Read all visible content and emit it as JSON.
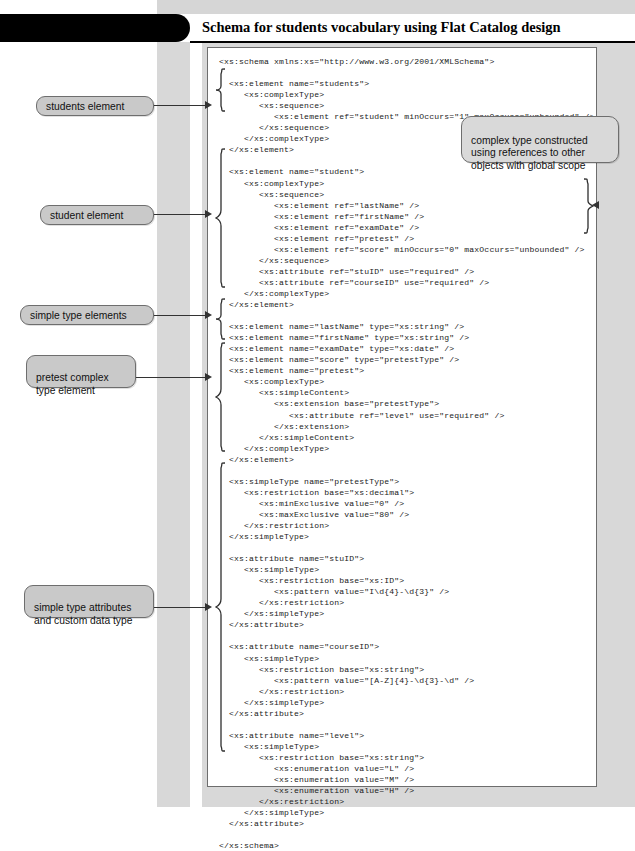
{
  "figure": {
    "tab_label": "Figure 4-1",
    "title": "Schema for students vocabulary using Flat Catalog design"
  },
  "code": {
    "language": "xml",
    "content": "<xs:schema xmlns:xs=\"http://www.w3.org/2001/XMLSchema\">\n\n  <xs:element name=\"students\">\n     <xs:complexType>\n        <xs:sequence>\n           <xs:element ref=\"student\" minOccurs=\"1\" maxOccurs=\"unbounded\" />\n        </xs:sequence>\n     </xs:complexType>\n  </xs:element>\n\n  <xs:element name=\"student\">\n     <xs:complexType>\n        <xs:sequence>\n           <xs:element ref=\"lastName\" />\n           <xs:element ref=\"firstName\" />\n           <xs:element ref=\"examDate\" />\n           <xs:element ref=\"pretest\" />\n           <xs:element ref=\"score\" minOccurs=\"0\" maxOccurs=\"unbounded\" />\n        </xs:sequence>\n        <xs:attribute ref=\"stuID\" use=\"required\" />\n        <xs:attribute ref=\"courseID\" use=\"required\" />\n     </xs:complexType>\n  </xs:element>\n\n  <xs:element name=\"lastName\" type=\"xs:string\" />\n  <xs:element name=\"firstName\" type=\"xs:string\" />\n  <xs:element name=\"examDate\" type=\"xs:date\" />\n  <xs:element name=\"score\" type=\"pretestType\" />\n  <xs:element name=\"pretest\">\n     <xs:complexType>\n        <xs:simpleContent>\n           <xs:extension base=\"pretestType\">\n              <xs:attribute ref=\"level\" use=\"required\" />\n           </xs:extension>\n        </xs:simpleContent>\n     </xs:complexType>\n  </xs:element>\n\n  <xs:simpleType name=\"pretestType\">\n     <xs:restriction base=\"xs:decimal\">\n        <xs:minExclusive value=\"0\" />\n        <xs:maxExclusive value=\"80\" />\n     </xs:restriction>\n  </xs:simpleType>\n\n  <xs:attribute name=\"stuID\">\n     <xs:simpleType>\n        <xs:restriction base=\"xs:ID\">\n           <xs:pattern value=\"I\\d{4}-\\d{3}\" />\n        </xs:restriction>\n     </xs:simpleType>\n  </xs:attribute>\n\n  <xs:attribute name=\"courseID\">\n     <xs:simpleType>\n        <xs:restriction base=\"xs:string\">\n           <xs:pattern value=\"[A-Z]{4}-\\d{3}-\\d\" />\n        </xs:restriction>\n     </xs:simpleType>\n  </xs:attribute>\n\n  <xs:attribute name=\"level\">\n     <xs:simpleType>\n        <xs:restriction base=\"xs:string\">\n           <xs:enumeration value=\"L\" />\n           <xs:enumeration value=\"M\" />\n           <xs:enumeration value=\"H\" />\n        </xs:restriction>\n     </xs:simpleType>\n  </xs:attribute>\n\n</xs:schema>"
  },
  "annotations": {
    "left": [
      {
        "id": "students-element",
        "text": "students element"
      },
      {
        "id": "student-element",
        "text": "student element"
      },
      {
        "id": "simple-type-elements",
        "text": "simple type elements"
      },
      {
        "id": "pretest-complex-type-element",
        "text": "pretest complex\ntype element"
      },
      {
        "id": "simple-type-attributes",
        "text": "simple type attributes\nand custom data type"
      }
    ],
    "right": [
      {
        "id": "complex-type-note",
        "text": "complex type constructed\nusing references to other\nobjects with global scope"
      }
    ]
  },
  "colors": {
    "tab_background": "#000000",
    "tab_text": "#ffffff",
    "page_background": "#ffffff",
    "margin_background": "#d8d8d8",
    "callout_fill": "#c9c9c9",
    "callout_border": "#6e6e6e",
    "code_border": "#6d6d6d",
    "code_text": "#1a1a1a",
    "leader_line": "#333333"
  }
}
